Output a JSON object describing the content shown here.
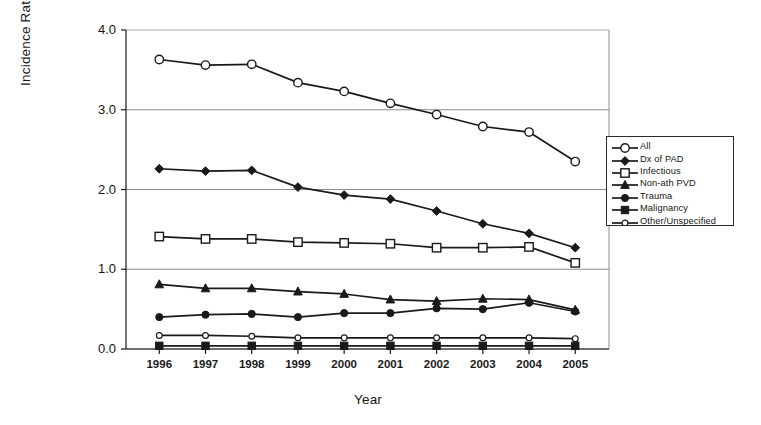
{
  "chart_data": {
    "type": "line",
    "title": "",
    "xlabel": "Year",
    "ylabel": "Incidence Rate (per 10,000 pop)",
    "categories": [
      "1996",
      "1997",
      "1998",
      "1999",
      "2000",
      "2001",
      "2002",
      "2003",
      "2004",
      "2005"
    ],
    "x": [
      1996,
      1997,
      1998,
      1999,
      2000,
      2001,
      2002,
      2003,
      2004,
      2005
    ],
    "ylim": [
      0.0,
      4.0
    ],
    "yticks": [
      "0.0",
      "1.0",
      "2.0",
      "3.0",
      "4.0"
    ],
    "ytick_values": [
      0.0,
      1.0,
      2.0,
      3.0,
      4.0
    ],
    "grid": "horizontal",
    "legend_position": "right",
    "series": [
      {
        "name": "All",
        "marker": "open-circle",
        "values": [
          3.63,
          3.56,
          3.57,
          3.34,
          3.23,
          3.08,
          2.94,
          2.79,
          2.72,
          2.35
        ]
      },
      {
        "name": "Dx of PAD",
        "marker": "filled-diamond",
        "values": [
          2.26,
          2.23,
          2.24,
          2.03,
          1.93,
          1.88,
          1.73,
          1.57,
          1.45,
          1.27
        ]
      },
      {
        "name": "Infectious",
        "marker": "open-square",
        "values": [
          1.41,
          1.38,
          1.38,
          1.34,
          1.33,
          1.32,
          1.27,
          1.27,
          1.28,
          1.08
        ]
      },
      {
        "name": "Non-ath PVD",
        "marker": "filled-triangle",
        "values": [
          0.81,
          0.76,
          0.76,
          0.72,
          0.69,
          0.62,
          0.6,
          0.63,
          0.62,
          0.49
        ]
      },
      {
        "name": "Trauma",
        "marker": "filled-circle",
        "values": [
          0.4,
          0.43,
          0.44,
          0.4,
          0.45,
          0.45,
          0.51,
          0.5,
          0.58,
          0.47
        ]
      },
      {
        "name": "Malignancy",
        "marker": "filled-square",
        "values": [
          0.04,
          0.04,
          0.04,
          0.04,
          0.04,
          0.04,
          0.04,
          0.04,
          0.04,
          0.04
        ]
      },
      {
        "name": "Other/Unspecified",
        "marker": "small-open-circle",
        "values": [
          0.17,
          0.17,
          0.16,
          0.14,
          0.14,
          0.14,
          0.14,
          0.14,
          0.14,
          0.13
        ]
      }
    ]
  },
  "colors": {
    "line": "#1a1a1a",
    "grid": "#8c8c8c",
    "axis": "#1a1a1a",
    "text": "#141414",
    "background": "#ffffff"
  }
}
